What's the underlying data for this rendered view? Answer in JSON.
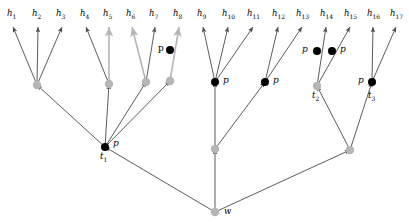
{
  "figure": {
    "background_color": "#ffffff",
    "width": 409,
    "height": 223
  },
  "style": {
    "edge_color": "#4a4a4a",
    "internal_node_color": "#b5b5b5",
    "mutation_node_color": "#000000",
    "label_color": "#000000"
  },
  "leaves": [
    {
      "id": "h1",
      "label": "h",
      "sub": "1",
      "x": 13,
      "y": 15,
      "tip_x": 13,
      "tip_y": 26
    },
    {
      "id": "h2",
      "label": "h",
      "sub": "2",
      "x": 38,
      "y": 15,
      "tip_x": 38,
      "tip_y": 26
    },
    {
      "id": "h3",
      "label": "h",
      "sub": "3",
      "x": 62,
      "y": 15,
      "tip_x": 62,
      "tip_y": 26
    },
    {
      "id": "h4",
      "label": "h",
      "sub": "4",
      "x": 86,
      "y": 15,
      "tip_x": 86,
      "tip_y": 26
    },
    {
      "id": "h5",
      "label": "h",
      "sub": "5",
      "x": 109,
      "y": 15,
      "tip_x": 109,
      "tip_y": 26
    },
    {
      "id": "h6",
      "label": "h",
      "sub": "6",
      "x": 132,
      "y": 15,
      "tip_x": 132,
      "tip_y": 26
    },
    {
      "id": "h7",
      "label": "h",
      "sub": "7",
      "x": 155,
      "y": 15,
      "tip_x": 155,
      "tip_y": 26
    },
    {
      "id": "h8",
      "label": "h",
      "sub": "8",
      "x": 179,
      "y": 15,
      "tip_x": 179,
      "tip_y": 26
    },
    {
      "id": "h9",
      "label": "h",
      "sub": "9",
      "x": 203,
      "y": 15,
      "tip_x": 203,
      "tip_y": 26
    },
    {
      "id": "h10",
      "label": "h",
      "sub": "10",
      "x": 228,
      "y": 15,
      "tip_x": 228,
      "tip_y": 26
    },
    {
      "id": "h11",
      "label": "h",
      "sub": "11",
      "x": 253,
      "y": 15,
      "tip_x": 253,
      "tip_y": 26
    },
    {
      "id": "h12",
      "label": "h",
      "sub": "12",
      "x": 278,
      "y": 15,
      "tip_x": 278,
      "tip_y": 26
    },
    {
      "id": "h13",
      "label": "h",
      "sub": "13",
      "x": 302,
      "y": 15,
      "tip_x": 302,
      "tip_y": 26
    },
    {
      "id": "h14",
      "label": "h",
      "sub": "14",
      "x": 326,
      "y": 15,
      "tip_x": 326,
      "tip_y": 26
    },
    {
      "id": "h15",
      "label": "h",
      "sub": "15",
      "x": 350,
      "y": 15,
      "tip_x": 350,
      "tip_y": 26
    },
    {
      "id": "h16",
      "label": "h",
      "sub": "16",
      "x": 373,
      "y": 15,
      "tip_x": 373,
      "tip_y": 26
    },
    {
      "id": "h17",
      "label": "h",
      "sub": "17",
      "x": 396,
      "y": 15,
      "tip_x": 396,
      "tip_y": 26
    }
  ],
  "internal_nodes": [
    {
      "id": "n_a",
      "x": 37,
      "y": 85,
      "kind": "gray"
    },
    {
      "id": "n_b",
      "x": 109,
      "y": 84,
      "kind": "gray"
    },
    {
      "id": "n_c",
      "x": 146,
      "y": 82,
      "kind": "gray"
    },
    {
      "id": "n_d",
      "x": 170,
      "y": 81,
      "kind": "gray"
    },
    {
      "id": "n_e",
      "x": 215,
      "y": 82,
      "kind": "black"
    },
    {
      "id": "n_f",
      "x": 265,
      "y": 82,
      "kind": "black"
    },
    {
      "id": "t2",
      "x": 317,
      "y": 86,
      "kind": "gray"
    },
    {
      "id": "t3",
      "x": 372,
      "y": 82,
      "kind": "black"
    },
    {
      "id": "t1",
      "x": 105,
      "y": 147,
      "kind": "black"
    },
    {
      "id": "n_mid",
      "x": 215,
      "y": 149,
      "kind": "gray"
    },
    {
      "id": "n_rt",
      "x": 350,
      "y": 150,
      "kind": "gray"
    },
    {
      "id": "w",
      "x": 215,
      "y": 212,
      "kind": "gray"
    }
  ],
  "mutations": [
    {
      "id": "mut_h8",
      "x": 170,
      "y": 50,
      "label": "p",
      "label_x": 158,
      "label_y": 44,
      "label_style": "upright"
    },
    {
      "id": "mut_h14",
      "x": 317,
      "y": 51,
      "label": "p",
      "label_x": 302,
      "label_y": 45,
      "label_style": "italic"
    },
    {
      "id": "mut_h15",
      "x": 332,
      "y": 51,
      "label": "p",
      "label_x": 340,
      "label_y": 45,
      "label_style": "italic"
    }
  ],
  "node_labels": [
    {
      "id": "label_p_t1",
      "text": "p",
      "sub": "",
      "x": 113,
      "y": 139,
      "style": "italic"
    },
    {
      "id": "label_t1",
      "text": "t",
      "sub": "1",
      "x": 100,
      "y": 152,
      "style": "italic"
    },
    {
      "id": "label_p_e",
      "text": "p",
      "sub": "",
      "x": 223,
      "y": 76,
      "style": "italic"
    },
    {
      "id": "label_p_f",
      "text": "p",
      "sub": "",
      "x": 273,
      "y": 76,
      "style": "italic"
    },
    {
      "id": "label_t2",
      "text": "t",
      "sub": "2",
      "x": 312,
      "y": 91,
      "style": "italic"
    },
    {
      "id": "label_p_t3",
      "text": "p",
      "sub": "",
      "x": 358,
      "y": 76,
      "style": "italic"
    },
    {
      "id": "label_t3",
      "text": "t",
      "sub": "3",
      "x": 368,
      "y": 91,
      "style": "italic"
    },
    {
      "id": "label_w",
      "text": "w",
      "sub": "",
      "x": 224,
      "y": 207,
      "style": "italic"
    }
  ],
  "edges": [
    {
      "id": "e_h1",
      "from": "n_a",
      "to_x": 13,
      "to_y": 27,
      "arrow": true,
      "color": "#4a4a4a"
    },
    {
      "id": "e_h2",
      "from": "n_a",
      "to_x": 38,
      "to_y": 27,
      "arrow": true,
      "color": "#4a4a4a"
    },
    {
      "id": "e_h3",
      "from": "n_a",
      "to_x": 62,
      "to_y": 27,
      "arrow": true,
      "color": "#4a4a4a"
    },
    {
      "id": "e_h4",
      "from": "n_b",
      "to_x": 86,
      "to_y": 27,
      "arrow": true,
      "color": "#4a4a4a"
    },
    {
      "id": "e_h5",
      "from": "n_b",
      "to_x": 109,
      "to_y": 27,
      "arrow": true,
      "color": "#b5b5b5"
    },
    {
      "id": "e_h6",
      "from": "n_c",
      "to_x": 132,
      "to_y": 27,
      "arrow": true,
      "color": "#b5b5b5"
    },
    {
      "id": "e_h7",
      "from": "n_c",
      "to_x": 155,
      "to_y": 27,
      "arrow": true,
      "color": "#4a4a4a"
    },
    {
      "id": "e_h8",
      "from": "n_d",
      "to_x": 179,
      "to_y": 27,
      "arrow": true,
      "color": "#b5b5b5"
    },
    {
      "id": "e_h9",
      "from": "n_e",
      "to_x": 203,
      "to_y": 27,
      "arrow": true,
      "color": "#4a4a4a"
    },
    {
      "id": "e_h10",
      "from": "n_e",
      "to_x": 228,
      "to_y": 27,
      "arrow": true,
      "color": "#4a4a4a"
    },
    {
      "id": "e_h11",
      "from": "n_e",
      "to_x": 253,
      "to_y": 27,
      "arrow": true,
      "color": "#4a4a4a"
    },
    {
      "id": "e_h12",
      "from": "n_f",
      "to_x": 278,
      "to_y": 27,
      "arrow": true,
      "color": "#4a4a4a"
    },
    {
      "id": "e_h13",
      "from": "n_f",
      "to_x": 302,
      "to_y": 27,
      "arrow": true,
      "color": "#4a4a4a"
    },
    {
      "id": "e_h14",
      "from": "t2",
      "to_x": 326,
      "to_y": 27,
      "arrow": true,
      "color": "#4a4a4a"
    },
    {
      "id": "e_h15",
      "from": "t2",
      "to_x": 350,
      "to_y": 27,
      "arrow": true,
      "color": "#4a4a4a"
    },
    {
      "id": "e_h16",
      "from": "t3",
      "to_x": 373,
      "to_y": 27,
      "arrow": true,
      "color": "#4a4a4a"
    },
    {
      "id": "e_h17",
      "from": "t3",
      "to_x": 396,
      "to_y": 27,
      "arrow": true,
      "color": "#4a4a4a"
    },
    {
      "id": "e_t1_a",
      "from": "t1",
      "to_x": 37,
      "to_y": 85,
      "arrow": true,
      "color": "#4a4a4a"
    },
    {
      "id": "e_t1_b",
      "from": "t1",
      "to_x": 109,
      "to_y": 84,
      "arrow": true,
      "color": "#4a4a4a"
    },
    {
      "id": "e_t1_c",
      "from": "t1",
      "to_x": 146,
      "to_y": 82,
      "arrow": true,
      "color": "#4a4a4a"
    },
    {
      "id": "e_t1_d",
      "from": "t1",
      "to_x": 170,
      "to_y": 81,
      "arrow": true,
      "color": "#4a4a4a"
    },
    {
      "id": "e_m_e",
      "from": "n_mid",
      "to_x": 215,
      "to_y": 82,
      "arrow": true,
      "color": "#4a4a4a"
    },
    {
      "id": "e_m_f",
      "from": "n_mid",
      "to_x": 265,
      "to_y": 82,
      "arrow": true,
      "color": "#4a4a4a"
    },
    {
      "id": "e_r_t2",
      "from": "n_rt",
      "to_x": 317,
      "to_y": 86,
      "arrow": true,
      "color": "#4a4a4a"
    },
    {
      "id": "e_r_t3",
      "from": "n_rt",
      "to_x": 372,
      "to_y": 82,
      "arrow": true,
      "color": "#4a4a4a"
    },
    {
      "id": "e_w_t1",
      "from": "w",
      "to_x": 105,
      "to_y": 147,
      "arrow": true,
      "color": "#4a4a4a"
    },
    {
      "id": "e_w_m",
      "from": "w",
      "to_x": 215,
      "to_y": 149,
      "arrow": true,
      "color": "#4a4a4a"
    },
    {
      "id": "e_w_r",
      "from": "w",
      "to_x": 350,
      "to_y": 150,
      "arrow": true,
      "color": "#4a4a4a"
    }
  ]
}
